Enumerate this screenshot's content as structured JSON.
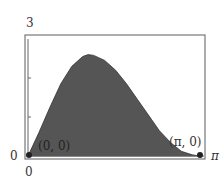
{
  "chart_data": {
    "type": "area",
    "title": "",
    "xlabel": "",
    "ylabel": "",
    "xlim": [
      0,
      3.1416
    ],
    "ylim": [
      0,
      3
    ],
    "x_tick_labels": [
      "0",
      "π"
    ],
    "y_tick_labels": [
      "0",
      "3"
    ],
    "grid": false,
    "x": [
      0,
      0.2,
      0.4,
      0.6,
      0.8,
      1.0,
      1.1,
      1.2,
      1.4,
      1.6,
      1.8,
      2.0,
      2.2,
      2.4,
      2.6,
      2.8,
      3.0,
      3.1416
    ],
    "values": [
      0,
      0.6,
      1.25,
      1.85,
      2.3,
      2.55,
      2.6,
      2.58,
      2.45,
      2.2,
      1.85,
      1.45,
      1.05,
      0.65,
      0.35,
      0.12,
      0.03,
      0
    ],
    "fill_color": "#555555",
    "annotations": [
      {
        "text": "(0, 0)",
        "x": 0,
        "y": 0
      },
      {
        "text": "(π, 0)",
        "x": 3.1416,
        "y": 0
      }
    ]
  },
  "labels": {
    "y_top": "3",
    "y_zero": "0",
    "x_zero": "0",
    "x_pi": "π",
    "point_origin": "(0, 0)",
    "point_pi": "(π, 0)"
  }
}
